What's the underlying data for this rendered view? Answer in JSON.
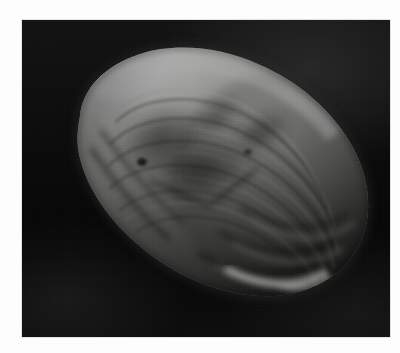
{
  "page": {
    "background_color": "#fdfdfd",
    "width": 400,
    "height": 353,
    "caption_fragment": "",
    "caption_visible": false
  },
  "plate": {
    "kind": "photograph",
    "background_color": "#0a0a0a",
    "border_color": "#e2e2e2",
    "left": 22,
    "top": 20,
    "width": 368,
    "height": 317
  },
  "subject": {
    "name": "bivalve-shell",
    "common_name": "clam shell",
    "view": "exterior lateral view, umbo upper-left, posterior margin right",
    "orientation": "tilted, long axis running upper-left to lower-right",
    "color_mode": "grayscale",
    "features": [
      "umbo highlight",
      "concentric growth rings",
      "ventral margin ridges",
      "central dark patch",
      "dorsal edge highlight"
    ]
  },
  "palette": {
    "highlight": "#f4f4f2",
    "light": "#dcdcd8",
    "midtone": "#9a9a96",
    "shade": "#5d5d5a",
    "dark": "#2e2e2c",
    "background": "#0a0a0a",
    "paper": "#fdfdfd"
  }
}
